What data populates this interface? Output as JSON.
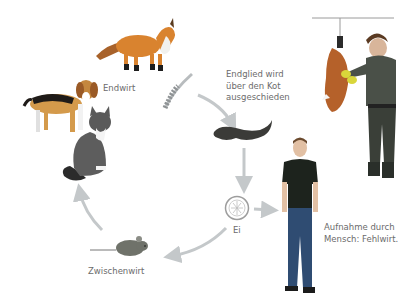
{
  "diagram": {
    "type": "life-cycle",
    "labels": {
      "final_host": "Endwirt",
      "segment_line1": "Endglied wird",
      "segment_line2": "über den Kot",
      "segment_line3": "ausgeschieden",
      "egg": "Ei",
      "human_line1": "Aufnahme durch",
      "human_line2": "Mensch: Fehlwirt.",
      "intermediate_host": "Zwischenwirt"
    },
    "nodes": [
      {
        "id": "fox",
        "role": "final-host"
      },
      {
        "id": "dog",
        "role": "final-host"
      },
      {
        "id": "cat",
        "role": "final-host"
      },
      {
        "id": "tapeworm",
        "role": "parasite"
      },
      {
        "id": "feces",
        "role": "excretion"
      },
      {
        "id": "egg",
        "role": "egg"
      },
      {
        "id": "human",
        "role": "accidental-host"
      },
      {
        "id": "mouse",
        "role": "intermediate-host"
      },
      {
        "id": "hunter-with-fox",
        "role": "exposure-scene"
      }
    ],
    "colors": {
      "arrow": "#c4c8ca",
      "text": "#6b6b6b",
      "fox": "#d9832f",
      "shirt": "#1d231d",
      "jeans": "#2f4c72"
    }
  }
}
